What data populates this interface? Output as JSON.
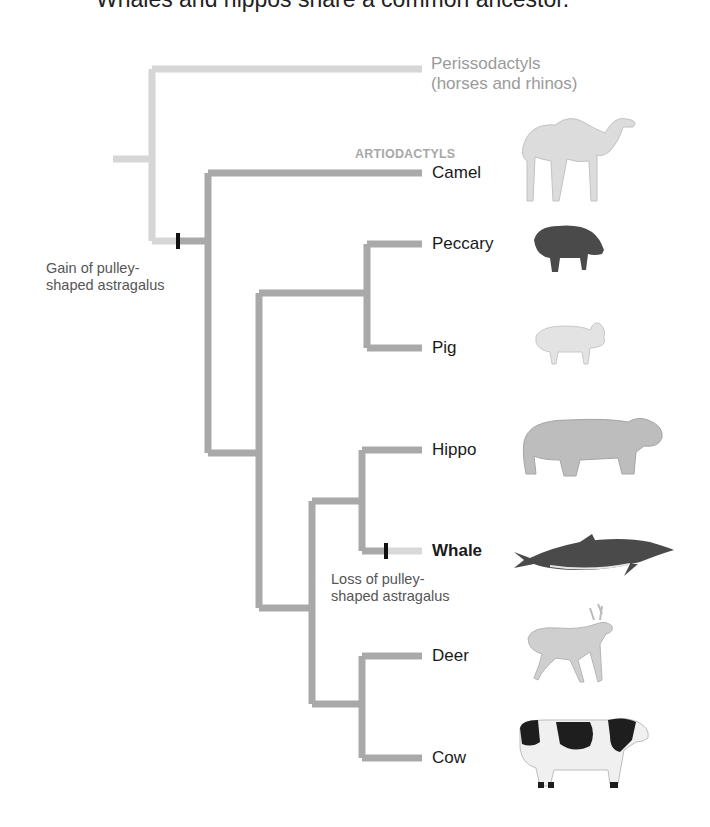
{
  "caption": "Whales and hippos share a common ancestor.",
  "outgroup": {
    "line1": "Perissodactyls",
    "line2": "(horses and rhinos)"
  },
  "group_label": "ARTIODACTYLS",
  "taxa": [
    {
      "name": "Camel",
      "bold": false,
      "icon": "camel-icon"
    },
    {
      "name": "Peccary",
      "bold": false,
      "icon": "peccary-icon"
    },
    {
      "name": "Pig",
      "bold": false,
      "icon": "pig-icon"
    },
    {
      "name": "Hippo",
      "bold": false,
      "icon": "hippo-icon"
    },
    {
      "name": "Whale",
      "bold": true,
      "icon": "whale-icon"
    },
    {
      "name": "Deer",
      "bold": false,
      "icon": "deer-icon"
    },
    {
      "name": "Cow",
      "bold": false,
      "icon": "cow-icon"
    }
  ],
  "annotations": {
    "gain": {
      "line1": "Gain of pulley-",
      "line2": "shaped astragalus"
    },
    "loss": {
      "line1": "Loss of pulley-",
      "line2": "shaped astragalus"
    }
  },
  "colors": {
    "outgroup_branch": "#d6d6d6",
    "ingroup_branch": "#a9a9a9",
    "marker": "#111111",
    "whale_tip": "#d9d9d9"
  }
}
